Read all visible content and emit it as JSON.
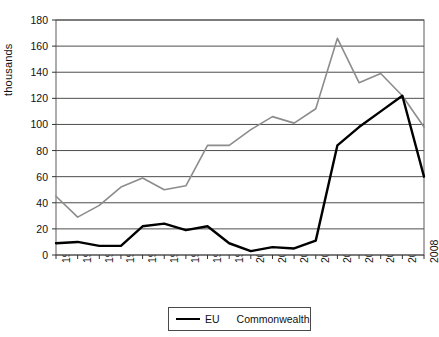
{
  "chart_data": {
    "type": "line",
    "title": "",
    "xlabel": "",
    "ylabel": "thousands",
    "ylim": [
      0,
      180
    ],
    "ytick_step": 20,
    "yticks": [
      0,
      20,
      40,
      60,
      80,
      100,
      120,
      140,
      160,
      180
    ],
    "grid": "horizontal",
    "legend_position": "bottom",
    "categories": [
      "1991",
      "1992",
      "1993",
      "1994",
      "1995",
      "1996",
      "1997",
      "1998",
      "1999",
      "2000",
      "2001",
      "2002",
      "2003",
      "2004",
      "2005",
      "2006",
      "2007",
      "2008"
    ],
    "series": [
      {
        "name": "EU",
        "color": "#000000",
        "values": [
          9,
          10,
          7,
          7,
          22,
          24,
          19,
          22,
          9,
          3,
          6,
          5,
          11,
          84,
          98,
          110,
          122,
          60
        ]
      },
      {
        "name": "Commonwealth",
        "color": "#8c8c8c",
        "values": [
          45,
          29,
          38,
          52,
          59,
          50,
          53,
          84,
          84,
          96,
          106,
          101,
          112,
          166,
          132,
          139,
          122,
          98
        ]
      }
    ]
  },
  "legend": {
    "items": [
      {
        "label": "EU"
      },
      {
        "label": "Commonwealth"
      }
    ]
  },
  "axes": {
    "y_title": "thousands"
  }
}
